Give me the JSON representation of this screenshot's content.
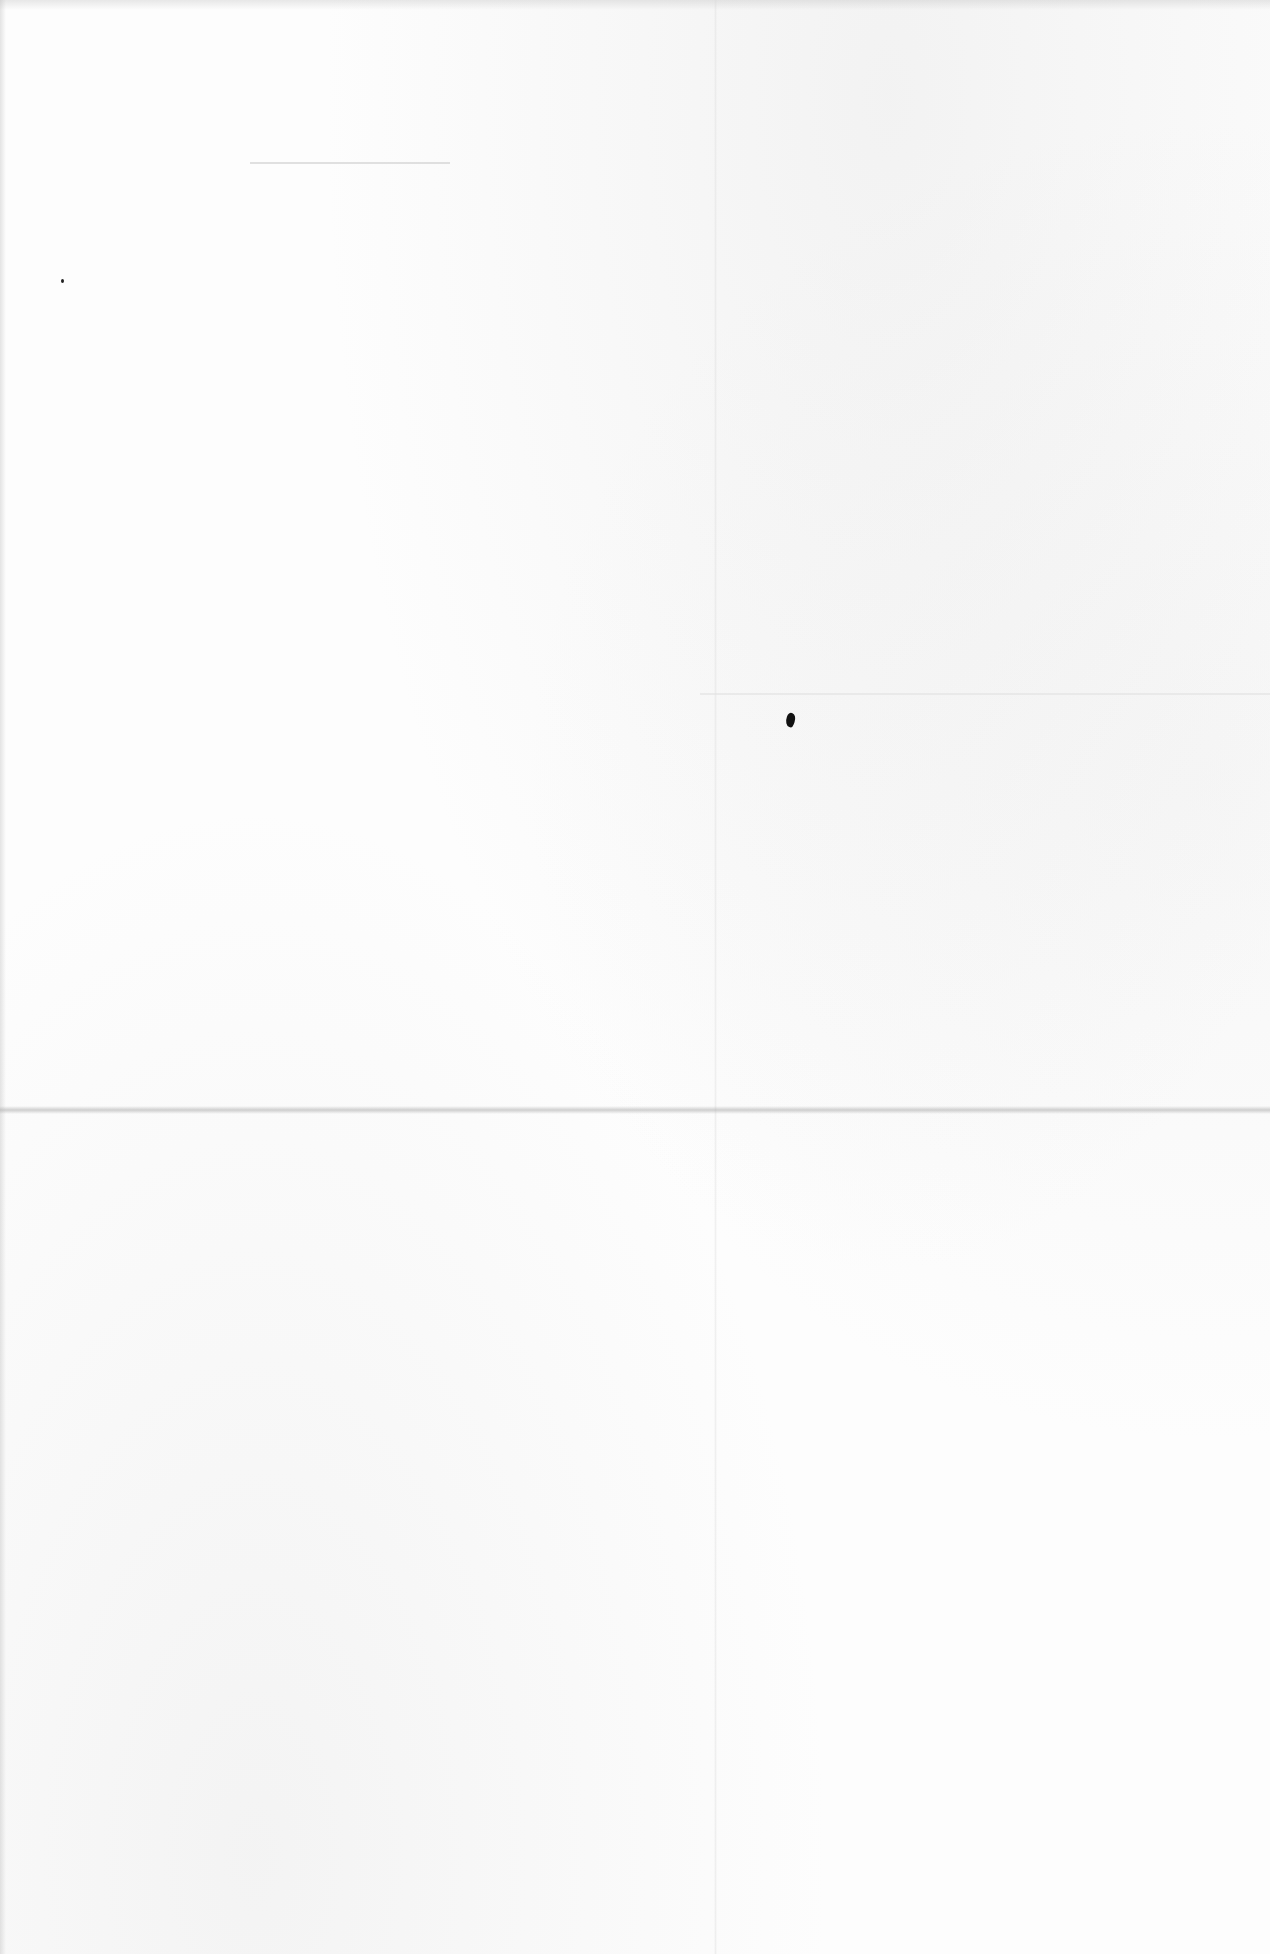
{
  "document": {
    "type": "blank scanned page",
    "text_content": [],
    "colors": {
      "paper": "#fdfdfd",
      "fold_line": "#aaaaaa",
      "ink_speck": "#111111"
    }
  }
}
